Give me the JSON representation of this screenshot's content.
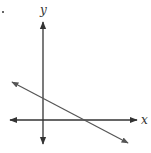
{
  "diagram": {
    "type": "coordinate-plane-line",
    "axes": {
      "x_label": "x",
      "y_label": "y"
    },
    "line": {
      "description": "line with negative slope, positive y-intercept and positive x-intercept",
      "slope_sign": "negative",
      "y_intercept_sign": "positive",
      "x_intercept_sign": "positive"
    },
    "marker": "•"
  },
  "colors": {
    "ink": "#333333",
    "line": "#555555",
    "background": "#ffffff"
  }
}
